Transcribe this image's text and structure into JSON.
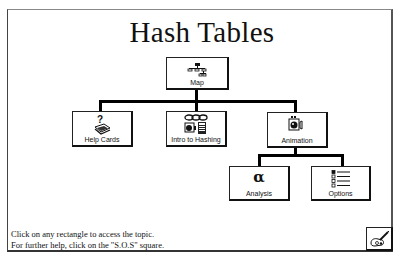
{
  "title": "Hash Tables",
  "nodes": {
    "map": {
      "label": "Map",
      "icon": "org-chart-icon"
    },
    "help_cards": {
      "label": "Help Cards",
      "icon": "question-card-stack-icon"
    },
    "intro": {
      "label": "Intro to Hashing",
      "icon": "chain-calculator-icon"
    },
    "animation": {
      "label": "Animation",
      "icon": "film-camera-icon"
    },
    "analysis": {
      "label": "Analysis",
      "icon": "alpha-icon",
      "glyph": "α"
    },
    "options": {
      "label": "Options",
      "icon": "checklist-icon"
    }
  },
  "instructions": {
    "line1": "Click on any rectangle to access the topic.",
    "line2": "For further help, click on the \"S.O.S\" square."
  },
  "sos_button": {
    "icon": "sos-hand-icon"
  }
}
